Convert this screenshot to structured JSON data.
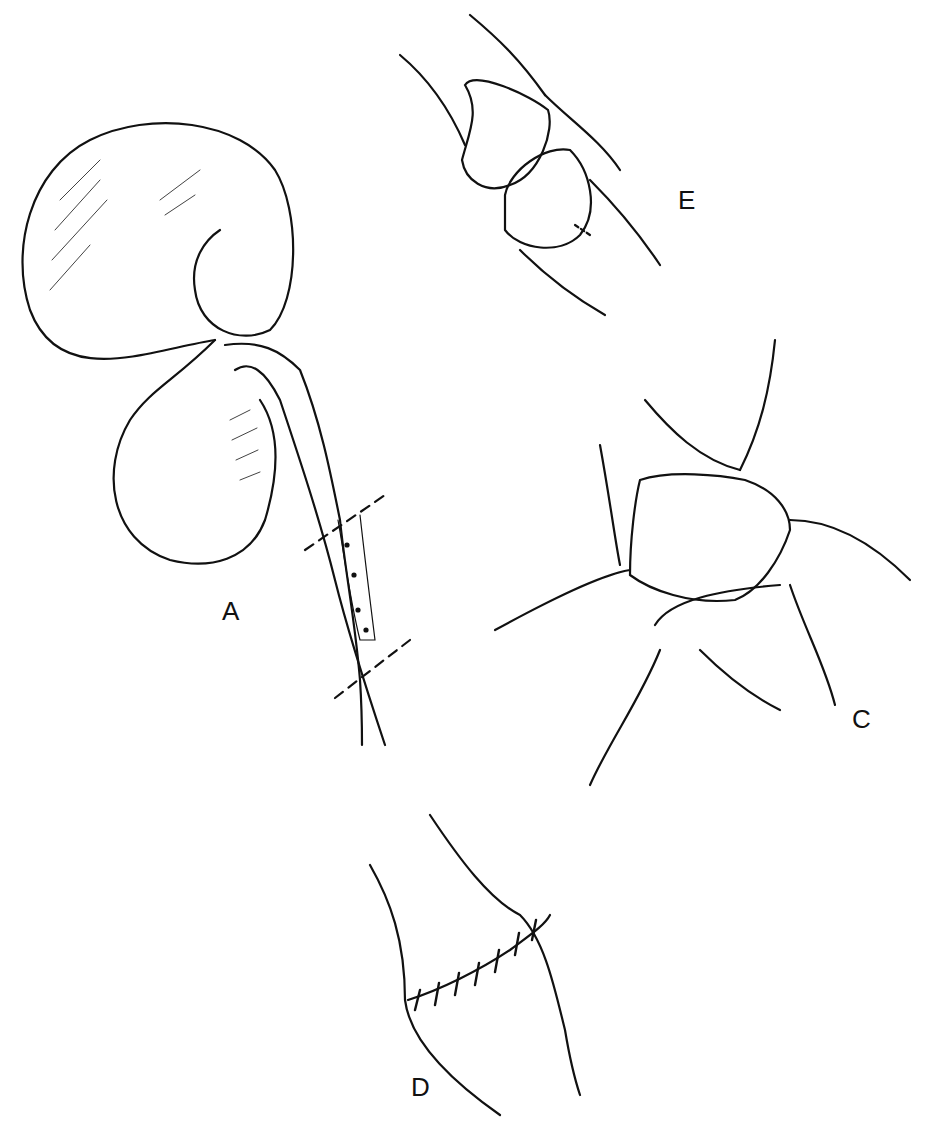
{
  "figure": {
    "panels": [
      {
        "id": "A",
        "label": "A",
        "content": "Kidney with ureter; diseased ureteral segment marked by two dashed resection lines"
      },
      {
        "id": "E",
        "label": "E",
        "content": "Two spatulated ureteral ends facing each other"
      },
      {
        "id": "C",
        "label": "C",
        "content": "Ureteral ends being approximated with stay sutures"
      },
      {
        "id": "D",
        "label": "D",
        "content": "Completed anastomosis with interrupted sutures"
      }
    ],
    "colors": {
      "line": "#111111",
      "background": "#ffffff"
    }
  }
}
